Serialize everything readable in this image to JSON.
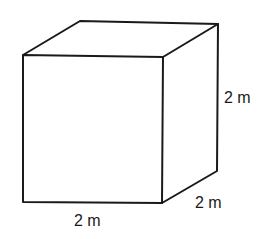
{
  "diagram": {
    "shape": "cube",
    "labels": {
      "height": "2 m",
      "depth": "2 m",
      "width": "2 m"
    },
    "colors": {
      "stroke": "#1a1a1a",
      "background": "#ffffff"
    }
  }
}
